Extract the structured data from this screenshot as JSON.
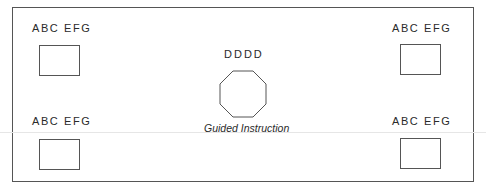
{
  "diagram": {
    "center": {
      "label": "DDDD",
      "shape": "octagon",
      "caption": "Guided Instruction"
    },
    "corners": [
      {
        "position": "top-left",
        "label": "ABC  EFG"
      },
      {
        "position": "top-right",
        "label": "ABC  EFG"
      },
      {
        "position": "bottom-left",
        "label": "ABC  EFG"
      },
      {
        "position": "bottom-right",
        "label": "ABC  EFG"
      }
    ]
  }
}
